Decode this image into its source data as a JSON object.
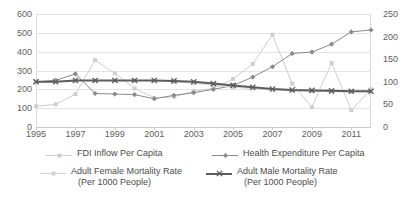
{
  "chart_data": {
    "type": "line",
    "title": "",
    "xlabel": "",
    "ylabel": "",
    "grid": true,
    "legend_position": "bottom",
    "x": [
      1995,
      1996,
      1997,
      1998,
      1999,
      2000,
      2001,
      2002,
      2003,
      2004,
      2005,
      2006,
      2007,
      2008,
      2009,
      2010,
      2011,
      2012
    ],
    "xtick_labels": [
      "1995",
      "1997",
      "1999",
      "2001",
      "2003",
      "2005",
      "2007",
      "2009",
      "2011"
    ],
    "xtick_values": [
      1995,
      1997,
      1999,
      2001,
      2003,
      2005,
      2007,
      2009,
      2011
    ],
    "xlim": [
      1995,
      2012
    ],
    "primary_axis": {
      "label": "",
      "ylim": [
        0,
        600
      ],
      "ytick_labels": [
        "0",
        "100",
        "200",
        "300",
        "400",
        "500",
        "600"
      ],
      "ytick_values": [
        0,
        100,
        200,
        300,
        400,
        500,
        600
      ]
    },
    "secondary_axis": {
      "label": "",
      "ylim": [
        0,
        250
      ],
      "ytick_labels": [
        "0",
        "50",
        "100",
        "150",
        "200",
        "250"
      ],
      "ytick_values": [
        0,
        50,
        100,
        150,
        200,
        250
      ]
    },
    "series": [
      {
        "name": "FDI Inflow Per Capita",
        "axis": "primary",
        "color": "#cfcfcf",
        "marker": "square",
        "line_width": 1,
        "values": [
          110,
          120,
          175,
          355,
          285,
          205,
          155,
          160,
          190,
          205,
          255,
          335,
          490,
          230,
          105,
          340,
          90,
          200
        ]
      },
      {
        "name": "Health Expenditure Per Capita",
        "axis": "primary",
        "color": "#8a8a8a",
        "marker": "diamond",
        "line_width": 1,
        "values": [
          240,
          248,
          282,
          178,
          175,
          172,
          150,
          168,
          182,
          200,
          220,
          265,
          320,
          390,
          398,
          440,
          505,
          515
        ]
      },
      {
        "name": "Adult Female Mortality Rate (Per 1000 People)",
        "axis": "secondary",
        "color": "#d4d4d4",
        "marker": "square",
        "line_width": 1,
        "values": [
          100,
          100,
          103,
          103,
          103,
          103,
          103,
          100,
          97,
          92,
          88,
          85,
          82,
          80,
          80,
          78,
          78,
          78
        ]
      },
      {
        "name": "Adult Male Mortality Rate (Per 1000 People)",
        "axis": "secondary",
        "color": "#5c5c5c",
        "marker": "cross",
        "line_width": 2,
        "values": [
          100,
          100,
          103,
          103,
          103,
          103,
          103,
          102,
          100,
          96,
          92,
          88,
          84,
          82,
          81,
          80,
          79,
          79
        ]
      }
    ]
  },
  "legend": [
    {
      "label": "FDI Inflow Per Capita",
      "sub": "",
      "color": "#cfcfcf",
      "marker": "square"
    },
    {
      "label": "Health Expenditure Per Capita",
      "sub": "",
      "color": "#8a8a8a",
      "marker": "diamond"
    },
    {
      "label": "Adult Female Mortality Rate",
      "sub": "(Per 1000 People)",
      "color": "#d4d4d4",
      "marker": "square"
    },
    {
      "label": "Adult Male Mortality Rate",
      "sub": "(Per 1000 People)",
      "color": "#5c5c5c",
      "marker": "cross"
    }
  ],
  "colors": {
    "background": "#ffffff",
    "gridline": "#e4e4e4",
    "axis": "#c9c9c9",
    "tick_text": "#5e5e5e",
    "legend_text": "#4d4d4d"
  }
}
